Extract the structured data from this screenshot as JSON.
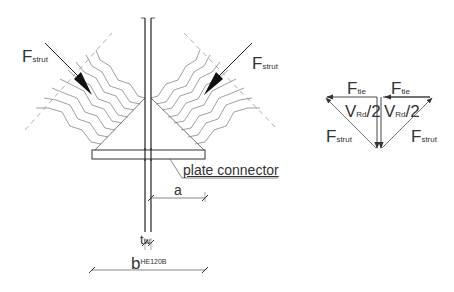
{
  "diagram": {
    "left_strut_label": {
      "main": "F",
      "sub": "strut"
    },
    "right_strut_label": {
      "main": "F",
      "sub": "strut"
    },
    "plate_label": "plate connector",
    "dim_a": "a",
    "dim_tw": {
      "main": "t",
      "sub": "w"
    },
    "dim_b": {
      "main": "b",
      "sub": "HE120B"
    },
    "force_polygon": {
      "left_tie": {
        "main": "F",
        "sub": "tie"
      },
      "right_tie": {
        "main": "F",
        "sub": "tie"
      },
      "left_shear": {
        "main": "V",
        "sub": "Rd",
        "tail": "/2"
      },
      "right_shear": {
        "main": "V",
        "sub": "Rd",
        "tail": "/2"
      },
      "left_strut": {
        "main": "F",
        "sub": "strut"
      },
      "right_strut": {
        "main": "F",
        "sub": "strut"
      }
    },
    "colors": {
      "line": "#333333",
      "hatch": "#777777",
      "dash": "#999999"
    }
  }
}
